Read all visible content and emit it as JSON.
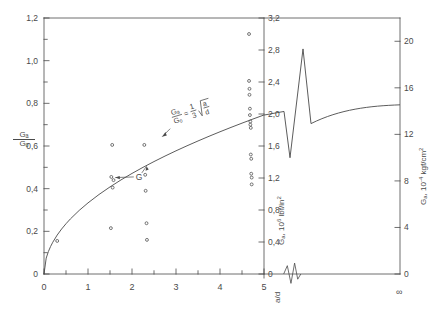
{
  "figure": {
    "title": "",
    "background": "#ffffff",
    "ink_color": "#4a4a4a"
  },
  "axes": {
    "x_bottom": {
      "label": "a/d",
      "ticks": [
        "0",
        "1",
        "2",
        "3",
        "4",
        "5"
      ],
      "tick_values": [
        0,
        1,
        2,
        3,
        4,
        5
      ],
      "minor_per_interval": 1,
      "break_after": 5,
      "end_label": "∞",
      "range": [
        0,
        5
      ]
    },
    "y_left": {
      "label_num": "Gₐ",
      "label_den": "Gₒ",
      "ticks": [
        "0",
        "0,2",
        "0,4",
        "0,6",
        "0,8",
        "1,0",
        "1,2"
      ],
      "tick_values": [
        0,
        0.2,
        0.4,
        0.6,
        0.8,
        1.0,
        1.2
      ],
      "minor_per_interval": 1,
      "range": [
        0,
        1.2
      ]
    },
    "y_mid": {
      "label_main": "G",
      "label_sub": "a",
      "label_rest": ", 10",
      "label_exp": "6",
      "label_units": "  lbf/in",
      "label_units_exp": "2",
      "ticks": [
        "0",
        "0,4",
        "0,8",
        "1,2",
        "1,6",
        "2,0",
        "2,4",
        "2,8",
        "3,2"
      ],
      "tick_values": [
        0,
        0.4,
        0.8,
        1.2,
        1.6,
        2.0,
        2.4,
        2.8,
        3.2
      ],
      "range": [
        0,
        3.2
      ]
    },
    "y_right": {
      "label_main": "G",
      "label_sub": "a",
      "label_rest": ", 10",
      "label_exp": "-4",
      "label_units": "  kgf/cm",
      "label_units_exp": "2",
      "ticks": [
        "0",
        "4",
        "8",
        "12",
        "16",
        "20"
      ],
      "tick_values": [
        0,
        4,
        8,
        12,
        16,
        20
      ],
      "range": [
        0,
        22
      ]
    }
  },
  "chart_data": {
    "type": "scatter",
    "title": "",
    "xlabel": "a/d",
    "ylabel": "Ga/Go",
    "xlim": [
      0,
      5
    ],
    "ylim": [
      0,
      1.2
    ],
    "grid": false,
    "legend": null,
    "annotations": [
      {
        "name": "curve-equation",
        "text_num": "Gₐ",
        "text_den": "Gₒ",
        "text_eq": "=",
        "frac_num": "1",
        "frac_den": "3",
        "radical_num": "a",
        "radical_den": "d",
        "formula_plain": "Ga/Go = (1/3)√(a/d)",
        "x": 3.05,
        "y": 0.7
      },
      {
        "name": "g-point-label",
        "text": "G",
        "x": 1.95,
        "y": 0.455
      }
    ],
    "series": [
      {
        "name": "theoretical-curve",
        "type": "line",
        "equation": "Ga/Go = (1/3)*sqrt(a/d)",
        "points_x": [
          0.0,
          0.05,
          0.1,
          0.15,
          0.2,
          0.3,
          0.4,
          0.5,
          0.6,
          0.8,
          1.0,
          1.25,
          1.5,
          1.75,
          2.0,
          2.25,
          2.5,
          2.75,
          3.0,
          3.25,
          3.5,
          3.75,
          4.0,
          4.25,
          4.5,
          4.75,
          5.0
        ],
        "points_y": [
          0.0,
          0.0745,
          0.1054,
          0.1291,
          0.1491,
          0.1826,
          0.2108,
          0.2357,
          0.2582,
          0.2981,
          0.3333,
          0.3727,
          0.4082,
          0.441,
          0.4714,
          0.5,
          0.527,
          0.5528,
          0.5774,
          0.6009,
          0.6236,
          0.6455,
          0.6667,
          0.6872,
          0.7071,
          0.7265,
          0.7454
        ]
      },
      {
        "name": "asymptote-segment",
        "type": "line",
        "points_x": [
          5.45,
          6.2
        ],
        "points_y": [
          0.745,
          0.775
        ],
        "note": "post-break continuation approaching infinity"
      },
      {
        "name": "measured-data",
        "type": "scatter",
        "marker": "open-circle",
        "points": [
          {
            "x": 0.3,
            "y": 0.155
          },
          {
            "x": 1.52,
            "y": 0.215
          },
          {
            "x": 1.53,
            "y": 0.455
          },
          {
            "x": 1.55,
            "y": 0.605
          },
          {
            "x": 1.56,
            "y": 0.405
          },
          {
            "x": 1.58,
            "y": 0.44
          },
          {
            "x": 2.28,
            "y": 0.605
          },
          {
            "x": 2.3,
            "y": 0.465
          },
          {
            "x": 2.31,
            "y": 0.39
          },
          {
            "x": 2.33,
            "y": 0.238
          },
          {
            "x": 2.34,
            "y": 0.16
          },
          {
            "x": 4.66,
            "y": 1.125
          },
          {
            "x": 4.66,
            "y": 0.905
          },
          {
            "x": 4.67,
            "y": 0.868
          },
          {
            "x": 4.67,
            "y": 0.84
          },
          {
            "x": 4.68,
            "y": 0.775
          },
          {
            "x": 4.68,
            "y": 0.745
          },
          {
            "x": 4.69,
            "y": 0.715
          },
          {
            "x": 4.69,
            "y": 0.7
          },
          {
            "x": 4.7,
            "y": 0.685
          },
          {
            "x": 4.7,
            "y": 0.56
          },
          {
            "x": 4.71,
            "y": 0.54
          },
          {
            "x": 4.71,
            "y": 0.47
          },
          {
            "x": 4.72,
            "y": 0.452
          },
          {
            "x": 4.72,
            "y": 0.42
          }
        ]
      }
    ]
  }
}
